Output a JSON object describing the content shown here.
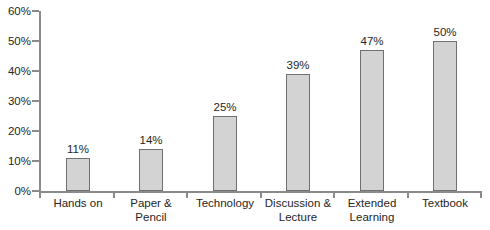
{
  "chart_data": {
    "type": "bar",
    "categories": [
      "Hands on",
      "Paper & Pencil",
      "Technology",
      "Discussion & Lecture",
      "Extended Learning",
      "Textbook"
    ],
    "category_lines": [
      [
        "Hands on"
      ],
      [
        "Paper &",
        "Pencil"
      ],
      [
        "Technology"
      ],
      [
        "Discussion &",
        "Lecture"
      ],
      [
        "Extended",
        "Learning"
      ],
      [
        "Textbook"
      ]
    ],
    "values": [
      11,
      14,
      25,
      39,
      47,
      50
    ],
    "value_labels": [
      "11%",
      "14%",
      "25%",
      "39%",
      "47%",
      "50%"
    ],
    "title": "",
    "xlabel": "",
    "ylabel": "",
    "ylim": [
      0,
      60
    ],
    "ytick_step": 10,
    "ytick_labels": [
      "0%",
      "10%",
      "20%",
      "30%",
      "40%",
      "50%",
      "60%"
    ],
    "grid": false,
    "legend_position": "none",
    "colors": {
      "bar_fill": "#d3d3d3",
      "bar_border": "#707070",
      "axis": "#8a8a8a",
      "text": "#262626",
      "background": "#ffffff"
    }
  }
}
